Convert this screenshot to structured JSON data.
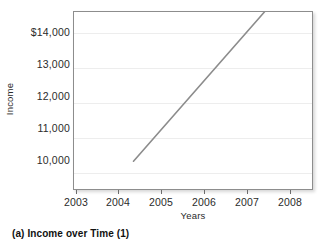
{
  "caption": "(a)  Income over Time (1)",
  "chart_data": {
    "type": "line",
    "title": "",
    "xlabel": "Years",
    "ylabel": "Income",
    "grid": true,
    "legend": false,
    "xlim": [
      2002.5,
      2008.5
    ],
    "ylim": [
      9500,
      14600
    ],
    "x_ticks": [
      "2003",
      "2004",
      "2005",
      "2006",
      "2007",
      "2008"
    ],
    "x_tick_values": [
      2003,
      2004,
      2005,
      2006,
      2007,
      2008
    ],
    "y_ticks": [
      "10,000",
      "11,000",
      "12,000",
      "13,000",
      "$14,000"
    ],
    "y_tick_values": [
      10000,
      11000,
      12000,
      13000,
      14000
    ],
    "series": [
      {
        "name": "Income",
        "color": "#8c8c8c",
        "x": [
          2004,
          2007.3
        ],
        "values": [
          10300,
          14600
        ]
      }
    ]
  }
}
